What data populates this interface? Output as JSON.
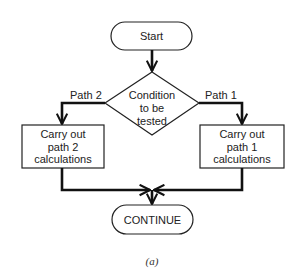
{
  "diagram": {
    "type": "flowchart",
    "start": {
      "label": "Start"
    },
    "decision": {
      "lines": [
        "Condition",
        "to be",
        "tested"
      ]
    },
    "branches": [
      {
        "label": "Path 2",
        "side": "left",
        "box_lines": [
          "Carry out",
          "path 2",
          "calculations"
        ]
      },
      {
        "label": "Path 1",
        "side": "right",
        "box_lines": [
          "Carry out",
          "path 1",
          "calculations"
        ]
      }
    ],
    "end": {
      "label": "CONTINUE"
    },
    "caption": "(a)",
    "colors": {
      "line": "#111111",
      "shape_stroke": "#222222",
      "background": "#ffffff"
    }
  }
}
